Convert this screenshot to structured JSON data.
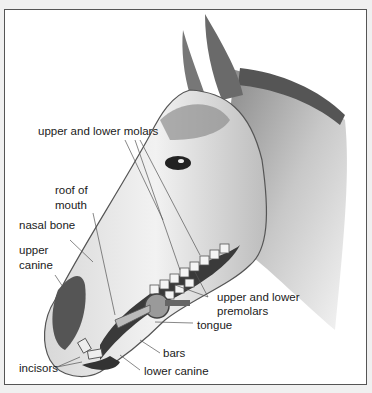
{
  "diagram": {
    "labels": {
      "upper_lower_molars": "upper and lower molars",
      "roof_of_mouth_1": "roof of",
      "roof_of_mouth_2": "mouth",
      "nasal_bone": "nasal bone",
      "upper_canine_1": "upper",
      "upper_canine_2": "canine",
      "upper_lower_premolars_1": "upper and lower",
      "upper_lower_premolars_2": "premolars",
      "tongue": "tongue",
      "bars": "bars",
      "incisors": "incisors",
      "lower_canine": "lower canine"
    },
    "colors": {
      "background": "#f0f0f0",
      "panel": "#ffffff",
      "ink": "#1a1a1a",
      "frame": "#555555"
    }
  }
}
